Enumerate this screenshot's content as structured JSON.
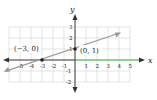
{
  "figure": {
    "axes": {
      "x_label": "x",
      "y_label": "y",
      "x_ticks": [
        "-6",
        "-5",
        "-4",
        "-3",
        "-2",
        "-1",
        "1",
        "2",
        "3",
        "4",
        "5"
      ],
      "y_ticks": [
        "3",
        "2",
        "1",
        "-1",
        "-2"
      ]
    },
    "points": [
      {
        "label": "(−3, 0)",
        "x": -3,
        "y": 0
      },
      {
        "label": "(0, 1)",
        "x": 0,
        "y": 1
      }
    ],
    "line": {
      "equation": "y = x/3 + 1",
      "color": "#999999"
    },
    "highlight_color": "#6cc06c",
    "grid_color": "#d8d8d8",
    "axis_color": "#333333"
  }
}
